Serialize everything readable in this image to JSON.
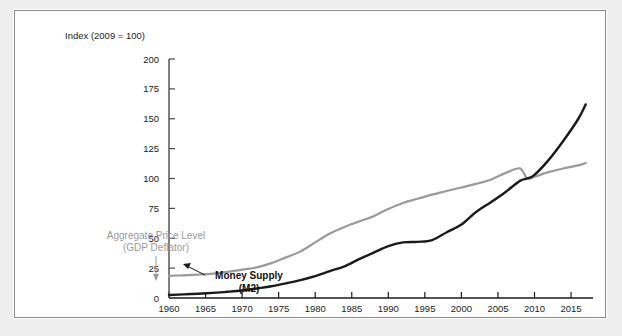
{
  "figure": {
    "title": "Index (2009 = 100)",
    "background_color": "#eeeeee",
    "panel_color": "#ffffff",
    "panel_border_color": "#8a8a8a"
  },
  "annotations": {
    "gray_series_line1": "Aggregate Price Level",
    "gray_series_line2": "(GDP Deflator)",
    "black_series_line1": "Money Supply",
    "black_series_line2": "(M2)"
  },
  "chart_data": {
    "type": "line",
    "title": "Index (2009 = 100)",
    "xlabel": "",
    "ylabel": "Index (2009 = 100)",
    "xlim": [
      1960,
      2018
    ],
    "ylim": [
      0,
      200
    ],
    "yticks": [
      0,
      25,
      50,
      75,
      100,
      125,
      150,
      175,
      200
    ],
    "ytick_labels": [
      "0",
      "25",
      "50",
      "75",
      "100",
      "125",
      "150",
      "175",
      "200"
    ],
    "xticks": [
      1960,
      1965,
      1970,
      1975,
      1980,
      1985,
      1990,
      1995,
      2000,
      2005,
      2010,
      2015
    ],
    "xtick_labels": [
      "1960",
      "1965",
      "1970",
      "1975",
      "1980",
      "1985",
      "1990",
      "1995",
      "2000",
      "2005",
      "2010",
      "2015"
    ],
    "grid": false,
    "legend": "inline-annotations",
    "colors": {
      "aggregate_price_level": "#9a9a9a",
      "money_supply": "#1a1a1a"
    },
    "x": [
      1960,
      1962,
      1964,
      1966,
      1968,
      1970,
      1972,
      1974,
      1976,
      1978,
      1980,
      1982,
      1984,
      1986,
      1988,
      1990,
      1992,
      1994,
      1996,
      1998,
      2000,
      2002,
      2004,
      2006,
      2008,
      2009,
      2010,
      2012,
      2014,
      2016,
      2017
    ],
    "series": [
      {
        "name": "Aggregate Price Level (GDP Deflator)",
        "color": "#9a9a9a",
        "values": [
          18.5,
          19.0,
          19.6,
          20.4,
          21.8,
          23.8,
          25.6,
          29.2,
          34.0,
          39.0,
          46.5,
          54.0,
          59.5,
          64.0,
          68.5,
          74.5,
          79.5,
          83.0,
          86.5,
          89.5,
          92.5,
          95.5,
          99.0,
          104.5,
          108.5,
          100.0,
          101.5,
          105.5,
          108.5,
          111.0,
          113.0
        ]
      },
      {
        "name": "Money Supply (M2)",
        "color": "#1a1a1a",
        "values": [
          2.5,
          3.0,
          3.6,
          4.3,
          5.2,
          6.3,
          8.0,
          9.8,
          12.3,
          15.0,
          18.3,
          22.5,
          26.5,
          32.5,
          38.0,
          43.5,
          46.5,
          47.0,
          48.5,
          55.0,
          61.5,
          72.0,
          80.0,
          88.5,
          98.0,
          100.0,
          103.0,
          116.0,
          132.0,
          150.0,
          162.0
        ]
      }
    ]
  }
}
